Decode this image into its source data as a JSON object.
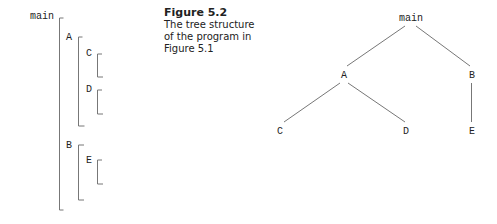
{
  "caption": {
    "title": "Figure 5.2",
    "lines": [
      "The tree structure",
      "of the program in",
      "Figure 5.1"
    ]
  },
  "bracket_diagram": {
    "labels": {
      "main": "main",
      "A": "A",
      "C": "C",
      "D": "D",
      "B": "B",
      "E": "E"
    }
  },
  "tree": {
    "nodes": {
      "main": "main",
      "A": "A",
      "B": "B",
      "C": "C",
      "D": "D",
      "E": "E"
    },
    "edges": [
      [
        "main",
        "A"
      ],
      [
        "main",
        "B"
      ],
      [
        "A",
        "C"
      ],
      [
        "A",
        "D"
      ],
      [
        "B",
        "E"
      ]
    ]
  },
  "colors": {
    "line": "#777777",
    "text": "#222222"
  }
}
